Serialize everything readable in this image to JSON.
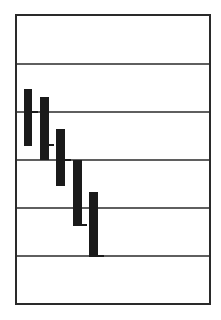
{
  "chart_data": {
    "type": "bar",
    "subtype": "high-low-close",
    "title": "",
    "xlabel": "",
    "ylabel": "",
    "grid": true,
    "legend": null,
    "frame": {
      "x": 16,
      "y": 15,
      "width": 194,
      "height": 289
    },
    "gridlines_y": [
      64,
      112,
      160,
      208,
      256
    ],
    "ylim": [
      0,
      6
    ],
    "yticks": [],
    "categories": [
      "1",
      "2",
      "3",
      "4",
      "5"
    ],
    "series": [
      {
        "name": "range",
        "high": [
          4.5,
          4.35,
          3.65,
          3.0,
          2.35
        ],
        "low": [
          3.3,
          3.0,
          2.45,
          1.65,
          1.0
        ],
        "close": [
          4.0,
          3.3,
          3.0,
          1.65,
          1.0
        ]
      }
    ],
    "bars_px": [
      {
        "x": 24,
        "w": 8,
        "top": 89,
        "bottom": 146,
        "tick_y": 112,
        "tick_x2": 38
      },
      {
        "x": 40,
        "w": 9,
        "top": 97,
        "bottom": 160,
        "tick_y": 145,
        "tick_x2": 54
      },
      {
        "x": 56,
        "w": 9,
        "top": 129,
        "bottom": 186,
        "tick_y": 160,
        "tick_x2": 71
      },
      {
        "x": 73,
        "w": 9,
        "top": 160,
        "bottom": 225,
        "tick_y": 225,
        "tick_x2": 87
      },
      {
        "x": 89,
        "w": 9,
        "top": 192,
        "bottom": 256,
        "tick_y": 256,
        "tick_x2": 104
      }
    ],
    "colors": {
      "bar": "#1a1a1a",
      "line": "#2a2a2a",
      "background": "#ffffff"
    }
  }
}
